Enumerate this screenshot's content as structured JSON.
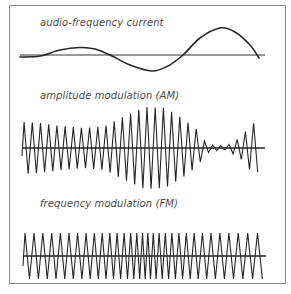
{
  "diagram": {
    "panels": [
      {
        "id": "audio",
        "label": "audio-frequency current",
        "label_pos": [
          40,
          17
        ],
        "baseline_y": 55,
        "x_start": 20,
        "x_end": 265,
        "curve_points": [
          [
            20,
            57
          ],
          [
            40,
            56
          ],
          [
            60,
            50
          ],
          [
            80,
            47.5
          ],
          [
            95,
            49
          ],
          [
            110,
            55
          ],
          [
            130,
            65
          ],
          [
            152,
            71
          ],
          [
            168,
            66
          ],
          [
            183,
            55
          ],
          [
            200,
            38
          ],
          [
            220,
            28
          ],
          [
            235,
            32
          ],
          [
            250,
            45
          ],
          [
            259,
            58
          ]
        ]
      },
      {
        "id": "am",
        "label": "amplitude modulation (AM)",
        "label_pos": [
          40,
          90
        ],
        "baseline_y": 148,
        "x_start": 22,
        "x_end": 265,
        "carrier_period": 8.2,
        "envelope": [
          [
            22,
            26
          ],
          [
            40,
            25
          ],
          [
            60,
            22
          ],
          [
            85,
            20
          ],
          [
            105,
            22
          ],
          [
            125,
            32
          ],
          [
            145,
            41
          ],
          [
            165,
            40
          ],
          [
            182,
            30
          ],
          [
            198,
            18
          ],
          [
            205,
            6
          ],
          [
            212,
            3
          ],
          [
            225,
            2
          ],
          [
            232,
            5
          ],
          [
            242,
            12
          ],
          [
            252,
            25
          ],
          [
            258,
            24
          ]
        ]
      },
      {
        "id": "fm",
        "label": "frequency modulation (FM)",
        "label_pos": [
          40,
          198
        ],
        "baseline_y": 256,
        "x_start": 23,
        "x_end": 266,
        "amplitude": 23,
        "period_profile": [
          [
            23,
            9
          ],
          [
            80,
            8.5
          ],
          [
            120,
            7
          ],
          [
            145,
            5.2
          ],
          [
            165,
            6.5
          ],
          [
            200,
            8.5
          ],
          [
            260,
            10
          ]
        ]
      }
    ],
    "colors": {
      "line": "#262626",
      "axis": "#333333",
      "frame": "#8a8a8a"
    }
  }
}
